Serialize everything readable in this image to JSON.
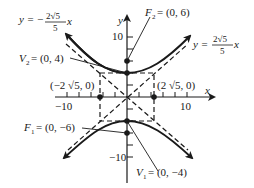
{
  "diagram": {
    "type": "hyperbola",
    "equation_family": "y^2/16 - x^2/20 = 1",
    "axes": {
      "x_label": "x",
      "y_label": "y",
      "x_ticks": {
        "neg": "−10",
        "pos": "10"
      },
      "y_ticks": {
        "pos": "10",
        "neg": "−10"
      }
    },
    "points": {
      "F2": {
        "name": "F",
        "sub": "2",
        "value": "= (0, 6)"
      },
      "F1": {
        "name": "F",
        "sub": "1",
        "value": "= (0, −6)"
      },
      "V2": {
        "name": "V",
        "sub": "2",
        "value": "= (0, 4)"
      },
      "V1": {
        "name": "V",
        "sub": "1",
        "value": "= (0, −4)"
      },
      "left_co": "(−2 √5, 0)",
      "right_co": "(2 √5, 0)"
    },
    "asymptotes": {
      "neg": {
        "lhs": "y = −",
        "num": "2√5",
        "den": "5",
        "var": "x"
      },
      "pos": {
        "lhs": "y =",
        "num": "2√5",
        "den": "5",
        "var": "x"
      }
    },
    "colors": {
      "ink": "#1a1a1a",
      "background": "#ffffff"
    }
  }
}
